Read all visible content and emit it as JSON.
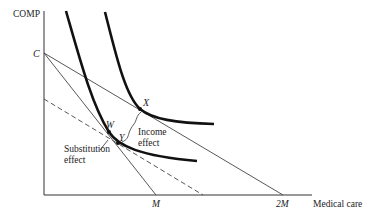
{
  "diagram": {
    "y_axis_label": "COMP",
    "x_axis_label": "Medical care",
    "points": {
      "C": "C",
      "X": "X",
      "W": "W",
      "Y": "Y"
    },
    "x_ticks": {
      "M": "M",
      "2M": "2M"
    },
    "annotations": {
      "income_effect_line1": "Income",
      "income_effect_line2": "effect",
      "substitution_effect_line1": "Substitution",
      "substitution_effect_line2": "effect"
    },
    "colors": {
      "axis": "#333333",
      "curve": "#111111",
      "budget_line": "#444444"
    }
  }
}
